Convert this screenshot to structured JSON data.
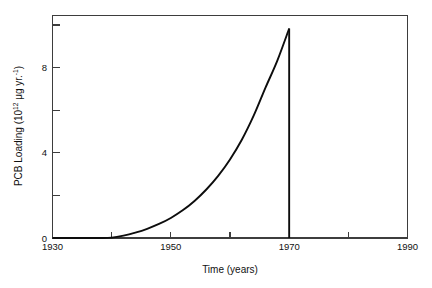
{
  "chart_data": {
    "type": "line",
    "title": "",
    "xlabel": "Time (years)",
    "ylabel": "PCB Loading (10¹² μg yr.⁻¹)",
    "ylabel_parts": {
      "prefix": "PCB Loading (10",
      "exponent": "12",
      "middle": " μg yr.",
      "exponent2": "-1",
      "suffix": ")"
    },
    "xlim": [
      1930,
      1990
    ],
    "ylim": [
      0,
      11.1
    ],
    "grid": false,
    "legend": null,
    "x_major_ticks": [
      1930,
      1950,
      1970,
      1990
    ],
    "x_minor_ticks": [
      1940,
      1960,
      1980
    ],
    "x_tick_labels": [
      "1930",
      "1950",
      "1970",
      "1990"
    ],
    "y_major_ticks": [
      0,
      4,
      8
    ],
    "y_minor_ticks": [
      2,
      6,
      10
    ],
    "y_tick_labels": [
      "0",
      "4",
      "8"
    ],
    "series": [
      {
        "name": "PCB loading",
        "x": [
          1930,
          1932,
          1934,
          1936,
          1938,
          1940,
          1942,
          1944,
          1946,
          1948,
          1950,
          1952,
          1954,
          1956,
          1958,
          1960,
          1962,
          1964,
          1966,
          1968,
          1970,
          1970
        ],
        "values": [
          0,
          0,
          0,
          0,
          0,
          0.02,
          0.12,
          0.27,
          0.46,
          0.7,
          1.0,
          1.38,
          1.85,
          2.42,
          3.1,
          3.92,
          4.9,
          6.1,
          7.5,
          8.85,
          10.45,
          0
        ]
      }
    ],
    "annotations": [
      {
        "text": "vertical drop to zero at 1970",
        "x": 1970,
        "y": 0
      }
    ],
    "colors": {
      "curve": "#0d0d0d",
      "axis": "#3d3d3d",
      "background": "#ffffff"
    }
  },
  "axis_titles": {
    "x": "Time (years)",
    "y_prefix": "PCB Loading (10",
    "y_exponent": "12",
    "y_middle": " μg yr.",
    "y_exponent2": "-1",
    "y_suffix": ")"
  }
}
